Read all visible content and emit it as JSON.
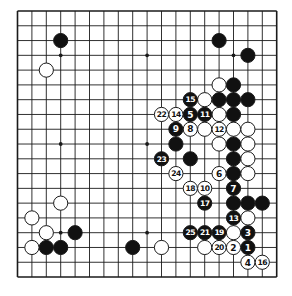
{
  "diagram": {
    "type": "go-board",
    "size": 19,
    "colors": {
      "background": "#ffffff",
      "line": "#1a1a1a",
      "black_stone": "#111111",
      "white_stone": "#ffffff",
      "black_label": "#ffffff",
      "white_label": "#111111"
    },
    "star_points": [
      [
        3,
        3
      ],
      [
        9,
        3
      ],
      [
        15,
        3
      ],
      [
        3,
        9
      ],
      [
        9,
        9
      ],
      [
        15,
        9
      ],
      [
        3,
        15
      ],
      [
        9,
        15
      ],
      [
        15,
        15
      ]
    ],
    "stones": [
      {
        "col": 3,
        "row": 2,
        "color": "black"
      },
      {
        "col": 14,
        "row": 2,
        "color": "black"
      },
      {
        "col": 16,
        "row": 3,
        "color": "black"
      },
      {
        "col": 15,
        "row": 5,
        "color": "black"
      },
      {
        "col": 14,
        "row": 6,
        "color": "black"
      },
      {
        "col": 15,
        "row": 6,
        "color": "black"
      },
      {
        "col": 16,
        "row": 6,
        "color": "black"
      },
      {
        "col": 15,
        "row": 7,
        "color": "black"
      },
      {
        "col": 11,
        "row": 9,
        "color": "black"
      },
      {
        "col": 15,
        "row": 9,
        "color": "black"
      },
      {
        "col": 12,
        "row": 10,
        "color": "black"
      },
      {
        "col": 15,
        "row": 10,
        "color": "black"
      },
      {
        "col": 15,
        "row": 11,
        "color": "black"
      },
      {
        "col": 15,
        "row": 13,
        "color": "black"
      },
      {
        "col": 16,
        "row": 13,
        "color": "black"
      },
      {
        "col": 17,
        "row": 13,
        "color": "black"
      },
      {
        "col": 4,
        "row": 15,
        "color": "black"
      },
      {
        "col": 2,
        "row": 16,
        "color": "black"
      },
      {
        "col": 3,
        "row": 16,
        "color": "black"
      },
      {
        "col": 8,
        "row": 16,
        "color": "black"
      },
      {
        "col": 2,
        "row": 4,
        "color": "white"
      },
      {
        "col": 14,
        "row": 5,
        "color": "white"
      },
      {
        "col": 13,
        "row": 6,
        "color": "white"
      },
      {
        "col": 14,
        "row": 7,
        "color": "white"
      },
      {
        "col": 13,
        "row": 8,
        "color": "white"
      },
      {
        "col": 15,
        "row": 8,
        "color": "white"
      },
      {
        "col": 16,
        "row": 8,
        "color": "white"
      },
      {
        "col": 14,
        "row": 9,
        "color": "white"
      },
      {
        "col": 16,
        "row": 9,
        "color": "white"
      },
      {
        "col": 16,
        "row": 10,
        "color": "white"
      },
      {
        "col": 16,
        "row": 11,
        "color": "white"
      },
      {
        "col": 16,
        "row": 14,
        "color": "white"
      },
      {
        "col": 15,
        "row": 15,
        "color": "white"
      },
      {
        "col": 13,
        "row": 16,
        "color": "white"
      },
      {
        "col": 10,
        "row": 16,
        "color": "white"
      },
      {
        "col": 3,
        "row": 13,
        "color": "white"
      },
      {
        "col": 1,
        "row": 14,
        "color": "white"
      },
      {
        "col": 2,
        "row": 15,
        "color": "white"
      },
      {
        "col": 1,
        "row": 16,
        "color": "white"
      },
      {
        "col": 16,
        "row": 16,
        "color": "black",
        "label": "1"
      },
      {
        "col": 15,
        "row": 16,
        "color": "white",
        "label": "2"
      },
      {
        "col": 16,
        "row": 15,
        "color": "black",
        "label": "3"
      },
      {
        "col": 16,
        "row": 17,
        "color": "white",
        "label": "4"
      },
      {
        "col": 12,
        "row": 7,
        "color": "black",
        "label": "5"
      },
      {
        "col": 14,
        "row": 11,
        "color": "white",
        "label": "6"
      },
      {
        "col": 15,
        "row": 12,
        "color": "black",
        "label": "7"
      },
      {
        "col": 12,
        "row": 8,
        "color": "white",
        "label": "8"
      },
      {
        "col": 11,
        "row": 8,
        "color": "black",
        "label": "9"
      },
      {
        "col": 13,
        "row": 12,
        "color": "white",
        "label": "10"
      },
      {
        "col": 13,
        "row": 7,
        "color": "black",
        "label": "11"
      },
      {
        "col": 14,
        "row": 8,
        "color": "white",
        "label": "12"
      },
      {
        "col": 15,
        "row": 14,
        "color": "black",
        "label": "13"
      },
      {
        "col": 11,
        "row": 7,
        "color": "white",
        "label": "14"
      },
      {
        "col": 12,
        "row": 6,
        "color": "black",
        "label": "15"
      },
      {
        "col": 17,
        "row": 17,
        "color": "white",
        "label": "16"
      },
      {
        "col": 13,
        "row": 13,
        "color": "black",
        "label": "17"
      },
      {
        "col": 12,
        "row": 12,
        "color": "white",
        "label": "18"
      },
      {
        "col": 14,
        "row": 15,
        "color": "black",
        "label": "19"
      },
      {
        "col": 14,
        "row": 16,
        "color": "white",
        "label": "20"
      },
      {
        "col": 13,
        "row": 15,
        "color": "black",
        "label": "21"
      },
      {
        "col": 10,
        "row": 7,
        "color": "white",
        "label": "22"
      },
      {
        "col": 10,
        "row": 10,
        "color": "black",
        "label": "23"
      },
      {
        "col": 11,
        "row": 11,
        "color": "white",
        "label": "24"
      },
      {
        "col": 12,
        "row": 15,
        "color": "black",
        "label": "25"
      }
    ]
  },
  "layout": {
    "origin_x": 17.5,
    "origin_y": 11,
    "step_x": 14.4,
    "step_y": 14.78,
    "stone_radius": 7.1
  }
}
